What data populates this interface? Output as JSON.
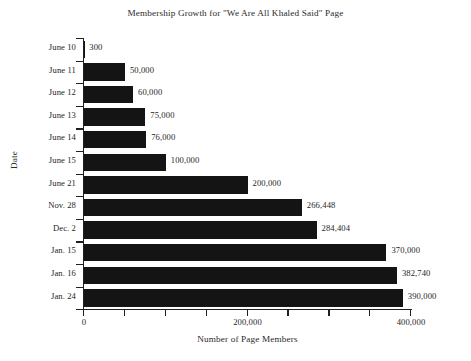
{
  "chart_data": {
    "type": "bar",
    "orientation": "horizontal",
    "title": "Membership Growth for \"We Are All Khaled Said\" Page",
    "xlabel": "Number of Page Members",
    "ylabel": "Date",
    "categories": [
      "June 10",
      "June 11",
      "June 12",
      "June 13",
      "June 14",
      "June 15",
      "June 21",
      "Nov. 28",
      "Dec. 2",
      "Jan. 15",
      "Jan. 16",
      "Jan. 24"
    ],
    "values": [
      300,
      50000,
      60000,
      75000,
      76000,
      100000,
      200000,
      266448,
      284404,
      370000,
      382740,
      390000
    ],
    "value_labels": [
      "300",
      "50,000",
      "60,000",
      "75,000",
      "76,000",
      "100,000",
      "200,000",
      "266,448",
      "284,404",
      "370,000",
      "382,740",
      "390,000"
    ],
    "xlim": [
      0,
      400000
    ],
    "x_major_ticks": [
      0,
      200000,
      400000
    ],
    "x_major_tick_labels": [
      "0",
      "200,000",
      "400,000"
    ],
    "x_minor_ticks": [
      50000,
      100000,
      150000,
      250000,
      300000,
      350000
    ],
    "grid": false,
    "legend": null,
    "bar_color": "#141414",
    "background_color": "#ffffff",
    "text_color": "#262626"
  }
}
